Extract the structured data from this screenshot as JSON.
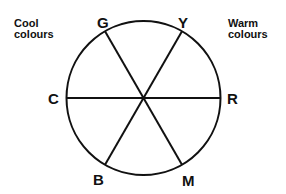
{
  "diagram": {
    "cool_label": [
      "Cool",
      "colours"
    ],
    "warm_label": [
      "Warm",
      "colours"
    ],
    "stroke_color": "#111111",
    "background": "#ffffff",
    "circle": {
      "cx": 143.5,
      "cy": 98,
      "r": 77
    },
    "nodes": [
      {
        "id": "G",
        "label": "G",
        "meaning": "Green",
        "angle_deg": 120
      },
      {
        "id": "Y",
        "label": "Y",
        "meaning": "Yellow",
        "angle_deg": 60
      },
      {
        "id": "R",
        "label": "R",
        "meaning": "Red",
        "angle_deg": 0
      },
      {
        "id": "M",
        "label": "M",
        "meaning": "Magenta",
        "angle_deg": -60
      },
      {
        "id": "B",
        "label": "B",
        "meaning": "Blue",
        "angle_deg": -120
      },
      {
        "id": "C",
        "label": "C",
        "meaning": "Cyan",
        "angle_deg": 180
      }
    ],
    "diameters": [
      [
        "C",
        "R"
      ],
      [
        "G",
        "M"
      ],
      [
        "Y",
        "B"
      ]
    ]
  }
}
